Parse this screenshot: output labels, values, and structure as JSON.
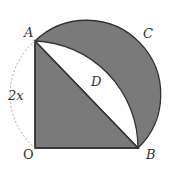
{
  "diagram": {
    "labels": {
      "A": "A",
      "B": "B",
      "C": "C",
      "D": "D",
      "O": "O",
      "side": "2x"
    },
    "colors": {
      "shade": "#7a7a7a",
      "stroke": "#333333",
      "dashed": "#aaaaaa",
      "background": "#ffffff"
    },
    "points": {
      "O": [
        35,
        148
      ],
      "A": [
        35,
        41
      ],
      "B": [
        138,
        148
      ]
    }
  }
}
